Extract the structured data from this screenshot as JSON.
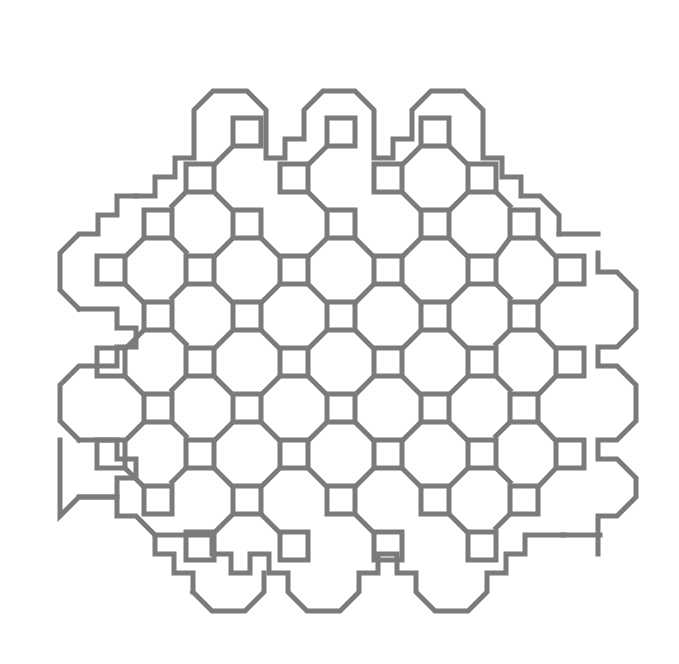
{
  "figure": {
    "canvas": {
      "width": 679,
      "height": 664,
      "background": "#ffffff"
    },
    "style": {
      "stroke_color": "#7b7b7b",
      "stroke_width": 5,
      "fill": "none",
      "line_cap": "square",
      "line_join": "miter"
    },
    "geometry": {
      "node_size": 28,
      "column_pitch": 47,
      "row_pitch": 46,
      "origin_x": 111,
      "origin_y": 132,
      "node_count": 74
    },
    "labels": {
      "alt_text": "Geometric maze pattern of connected squares",
      "caption": ""
    },
    "nodes": [
      {
        "cx": 247,
        "cy": 132
      },
      {
        "cx": 341,
        "cy": 132
      },
      {
        "cx": 435,
        "cy": 132
      },
      {
        "cx": 200,
        "cy": 178
      },
      {
        "cx": 294,
        "cy": 178
      },
      {
        "cx": 388,
        "cy": 178
      },
      {
        "cx": 482,
        "cy": 178
      },
      {
        "cx": 158,
        "cy": 224
      },
      {
        "cx": 247,
        "cy": 224
      },
      {
        "cx": 341,
        "cy": 224
      },
      {
        "cx": 435,
        "cy": 224
      },
      {
        "cx": 524,
        "cy": 224
      },
      {
        "cx": 111,
        "cy": 270
      },
      {
        "cx": 200,
        "cy": 270
      },
      {
        "cx": 294,
        "cy": 270
      },
      {
        "cx": 388,
        "cy": 270
      },
      {
        "cx": 482,
        "cy": 270
      },
      {
        "cx": 570,
        "cy": 270
      },
      {
        "cx": 158,
        "cy": 316
      },
      {
        "cx": 247,
        "cy": 316
      },
      {
        "cx": 341,
        "cy": 316
      },
      {
        "cx": 435,
        "cy": 316
      },
      {
        "cx": 524,
        "cy": 316
      },
      {
        "cx": 111,
        "cy": 362
      },
      {
        "cx": 200,
        "cy": 362
      },
      {
        "cx": 294,
        "cy": 362
      },
      {
        "cx": 388,
        "cy": 362
      },
      {
        "cx": 482,
        "cy": 362
      },
      {
        "cx": 570,
        "cy": 362
      },
      {
        "cx": 158,
        "cy": 408
      },
      {
        "cx": 247,
        "cy": 408
      },
      {
        "cx": 341,
        "cy": 408
      },
      {
        "cx": 435,
        "cy": 408
      },
      {
        "cx": 524,
        "cy": 408
      },
      {
        "cx": 111,
        "cy": 454
      },
      {
        "cx": 200,
        "cy": 454
      },
      {
        "cx": 294,
        "cy": 454
      },
      {
        "cx": 388,
        "cy": 454
      },
      {
        "cx": 482,
        "cy": 454
      },
      {
        "cx": 570,
        "cy": 454
      },
      {
        "cx": 158,
        "cy": 500
      },
      {
        "cx": 247,
        "cy": 500
      },
      {
        "cx": 341,
        "cy": 500
      },
      {
        "cx": 435,
        "cy": 500
      },
      {
        "cx": 524,
        "cy": 500
      },
      {
        "cx": 200,
        "cy": 546
      },
      {
        "cx": 294,
        "cy": 546
      },
      {
        "cx": 388,
        "cy": 546
      },
      {
        "cx": 482,
        "cy": 546
      }
    ]
  }
}
